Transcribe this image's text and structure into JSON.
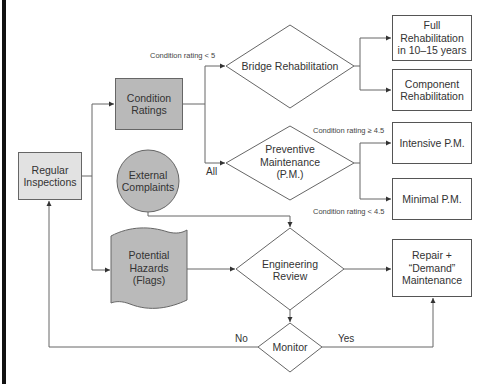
{
  "colors": {
    "line": "#666666",
    "box_fill": "#ffffff",
    "light_fill": "#e2e2e2",
    "dark_fill": "#b9b9b9",
    "frame_bar": "#111111"
  },
  "nodes": {
    "regular_inspections": {
      "label": "Regular Inspections",
      "shape": "rectangle"
    },
    "condition_ratings": {
      "label": "Condition Ratings",
      "shape": "rectangle"
    },
    "external_complaints": {
      "label": "External Complaints",
      "shape": "circle"
    },
    "potential_hazards": {
      "label": "Potential Hazards (Flags)",
      "shape": "document"
    },
    "bridge_rehabilitation": {
      "label": "Bridge Rehabilitation",
      "shape": "diamond"
    },
    "preventive_maintenance": {
      "line1": "Preventive",
      "line2": "Maintenance",
      "line3": "(P.M.)",
      "shape": "diamond"
    },
    "full_rehabilitation": {
      "label": "Full Rehabilitation in 10–15 years",
      "shape": "rectangle"
    },
    "component_rehabilitation": {
      "label": "Component Rehabilitation",
      "shape": "rectangle"
    },
    "intensive_pm": {
      "label": "Intensive P.M.",
      "shape": "rectangle"
    },
    "minimal_pm": {
      "label": "Minimal P.M.",
      "shape": "rectangle"
    },
    "engineering_review": {
      "label": "Engineering Review",
      "shape": "diamond"
    },
    "repair_demand": {
      "label": "Repair + “Demand” Maintenance",
      "shape": "rectangle"
    },
    "monitor": {
      "label": "Monitor",
      "shape": "diamond"
    }
  },
  "edge_labels": {
    "cond_lt_5": "Condition rating < 5",
    "all": "All",
    "cond_ge_45": "Condition rating ≥ 4.5",
    "cond_lt_45": "Condition rating < 4.5",
    "no": "No",
    "yes": "Yes"
  },
  "edges": [
    {
      "from": "regular_inspections",
      "to": "condition_ratings"
    },
    {
      "from": "regular_inspections",
      "to": "potential_hazards"
    },
    {
      "from": "condition_ratings",
      "to": "bridge_rehabilitation",
      "label": "Condition rating < 5"
    },
    {
      "from": "condition_ratings",
      "to": "preventive_maintenance",
      "label": "All"
    },
    {
      "from": "bridge_rehabilitation",
      "to": "full_rehabilitation"
    },
    {
      "from": "bridge_rehabilitation",
      "to": "component_rehabilitation"
    },
    {
      "from": "preventive_maintenance",
      "to": "intensive_pm",
      "label": "Condition rating ≥ 4.5"
    },
    {
      "from": "preventive_maintenance",
      "to": "minimal_pm",
      "label": "Condition rating < 4.5"
    },
    {
      "from": "external_complaints",
      "to": "engineering_review"
    },
    {
      "from": "potential_hazards",
      "to": "engineering_review"
    },
    {
      "from": "engineering_review",
      "to": "repair_demand"
    },
    {
      "from": "engineering_review",
      "to": "monitor"
    },
    {
      "from": "monitor",
      "to": "regular_inspections",
      "label": "No"
    },
    {
      "from": "monitor",
      "to": "repair_demand",
      "label": "Yes"
    }
  ]
}
